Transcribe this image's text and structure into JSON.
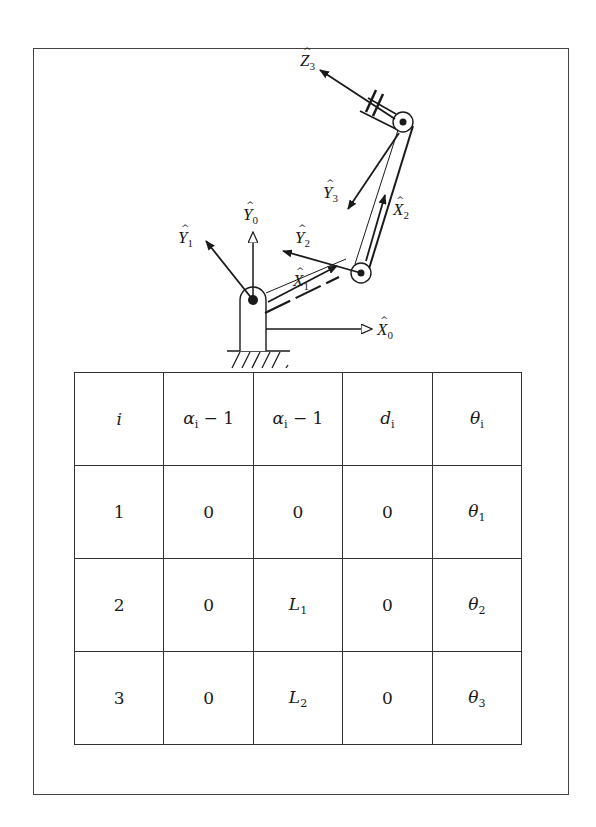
{
  "figure": {
    "axis_labels": {
      "Z3": {
        "hat": "^",
        "base": "Z",
        "sub": "3"
      },
      "Y3": {
        "hat": "^",
        "base": "Y",
        "sub": "3"
      },
      "X2": {
        "hat": "^",
        "base": "X",
        "sub": "2"
      },
      "Y2": {
        "hat": "^",
        "base": "Y",
        "sub": "2"
      },
      "X1": {
        "hat": "^",
        "base": "X",
        "sub": "1"
      },
      "Y1": {
        "hat": "^",
        "base": "Y",
        "sub": "1"
      },
      "Y0": {
        "hat": "^",
        "base": "Y",
        "sub": "0"
      },
      "X0": {
        "hat": "^",
        "base": "X",
        "sub": "0"
      }
    },
    "colors": {
      "line": "#1a1a1a",
      "frame": "#444444",
      "background": "#ffffff"
    }
  },
  "table": {
    "header": [
      {
        "base": "i",
        "sub": ""
      },
      {
        "base": "α",
        "sub": "i",
        "suffix": " − 1"
      },
      {
        "base": "α",
        "sub": "i",
        "suffix": " − 1"
      },
      {
        "base": "d",
        "sub": "i"
      },
      {
        "base": "θ",
        "sub": "i"
      }
    ],
    "rows": [
      [
        {
          "base": "1"
        },
        {
          "base": "0"
        },
        {
          "base": "0"
        },
        {
          "base": "0"
        },
        {
          "base": "θ",
          "sub": "1"
        }
      ],
      [
        {
          "base": "2"
        },
        {
          "base": "0"
        },
        {
          "base": "L",
          "sub": "1"
        },
        {
          "base": "0"
        },
        {
          "base": "θ",
          "sub": "2"
        }
      ],
      [
        {
          "base": "3"
        },
        {
          "base": "0"
        },
        {
          "base": "L",
          "sub": "2"
        },
        {
          "base": "0"
        },
        {
          "base": "θ",
          "sub": "3"
        }
      ]
    ]
  }
}
